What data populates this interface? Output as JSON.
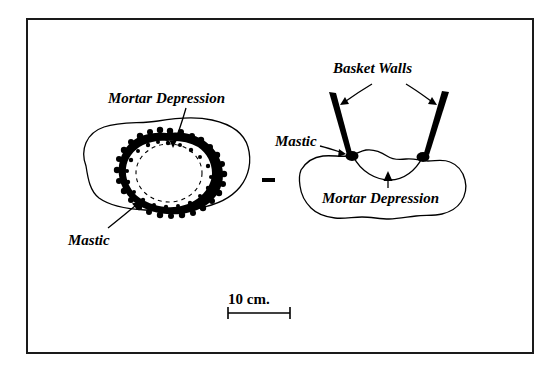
{
  "figure": {
    "type": "line-drawing",
    "border_color": "#1a1a1a",
    "background_color": "#ffffff",
    "ink_color": "#000000"
  },
  "labels": {
    "mortar_depression_left": "Mortar Depression",
    "mastic_left": "Mastic",
    "basket_walls": "Basket Walls",
    "mastic_right": "Mastic",
    "mortar_depression_right": "Mortar Depression",
    "scale": "10 cm."
  },
  "scale_bar": {
    "label": "10 cm.",
    "length_px": 62
  },
  "views": [
    {
      "name": "plan-view",
      "position": "left",
      "elements": [
        "stone-outline",
        "mastic-ring",
        "mortar-depression-dashed-circle"
      ]
    },
    {
      "name": "section-view",
      "position": "right",
      "elements": [
        "stone-outline",
        "mastic-blobs",
        "basket-wall-left",
        "basket-wall-right",
        "mortar-depression-curve"
      ]
    }
  ],
  "leader_lines": [
    {
      "name": "mortar-depression-left-leader",
      "from": "Mortar Depression",
      "to": "dashed-circle"
    },
    {
      "name": "mastic-left-leader",
      "from": "Mastic",
      "to": "mastic-ring"
    },
    {
      "name": "basket-walls-left-leader",
      "from": "Basket Walls",
      "to": "basket-wall-left"
    },
    {
      "name": "basket-walls-right-leader",
      "from": "Basket Walls",
      "to": "basket-wall-right"
    },
    {
      "name": "mastic-right-leader",
      "from": "Mastic",
      "to": "mastic-blob-left"
    },
    {
      "name": "mortar-depression-right-leader",
      "from": "Mortar Depression",
      "to": "depression-curve"
    }
  ]
}
